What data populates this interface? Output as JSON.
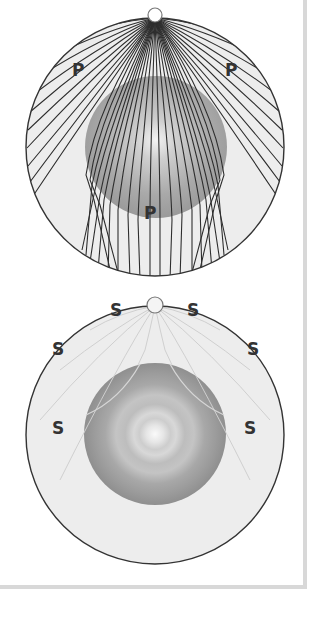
{
  "diagrams": [
    {
      "id": "p-wave",
      "wave_type": "P",
      "labels": [
        {
          "text": "P",
          "x": 78,
          "y": 76
        },
        {
          "text": "P",
          "x": 231,
          "y": 76
        },
        {
          "text": "P",
          "x": 150,
          "y": 219
        }
      ]
    },
    {
      "id": "s-wave",
      "wave_type": "S",
      "labels": [
        {
          "text": "S",
          "x": 116,
          "y": 312
        },
        {
          "text": "S",
          "x": 193,
          "y": 312
        },
        {
          "text": "S",
          "x": 58,
          "y": 354
        },
        {
          "text": "S",
          "x": 253,
          "y": 354
        },
        {
          "text": "S",
          "x": 58,
          "y": 434
        },
        {
          "text": "S",
          "x": 250,
          "y": 434
        }
      ]
    }
  ],
  "colors": {
    "mantle_fill": "#ededed",
    "outline": "#333333",
    "ray_p": "#2e2e2e",
    "ray_s": "#c8c8c8",
    "core_outer": "#999999",
    "core_inner": "#f6f6f6",
    "frame": "#d8d8d8"
  }
}
